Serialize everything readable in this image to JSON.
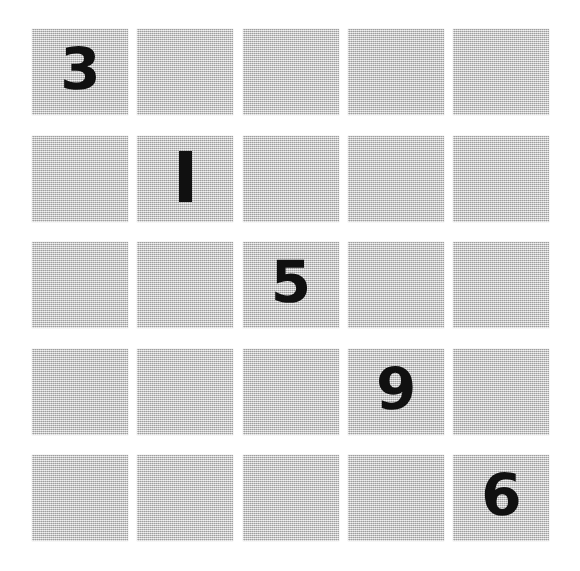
{
  "board": {
    "title": "5x5 diagonal number grid",
    "rows": 5,
    "columns": 5,
    "cell_fill_color": "#c9c9c9",
    "digit_color": "#101010",
    "background_color": "#ffffff",
    "cells": [
      [
        {
          "value": "3",
          "filled": true
        },
        {
          "value": "",
          "filled": false
        },
        {
          "value": "",
          "filled": false
        },
        {
          "value": "",
          "filled": false
        },
        {
          "value": "",
          "filled": false
        }
      ],
      [
        {
          "value": "",
          "filled": false
        },
        {
          "value": "1",
          "filled": true
        },
        {
          "value": "",
          "filled": false
        },
        {
          "value": "",
          "filled": false
        },
        {
          "value": "",
          "filled": false
        }
      ],
      [
        {
          "value": "",
          "filled": false
        },
        {
          "value": "",
          "filled": false
        },
        {
          "value": "5",
          "filled": true
        },
        {
          "value": "",
          "filled": false
        },
        {
          "value": "",
          "filled": false
        }
      ],
      [
        {
          "value": "",
          "filled": false
        },
        {
          "value": "",
          "filled": false
        },
        {
          "value": "",
          "filled": false
        },
        {
          "value": "9",
          "filled": true
        },
        {
          "value": "",
          "filled": false
        }
      ],
      [
        {
          "value": "",
          "filled": false
        },
        {
          "value": "",
          "filled": false
        },
        {
          "value": "",
          "filled": false
        },
        {
          "value": "",
          "filled": false
        },
        {
          "value": "6",
          "filled": true
        }
      ]
    ],
    "diagonal_sequence": [
      "3",
      "1",
      "5",
      "9",
      "6"
    ]
  }
}
